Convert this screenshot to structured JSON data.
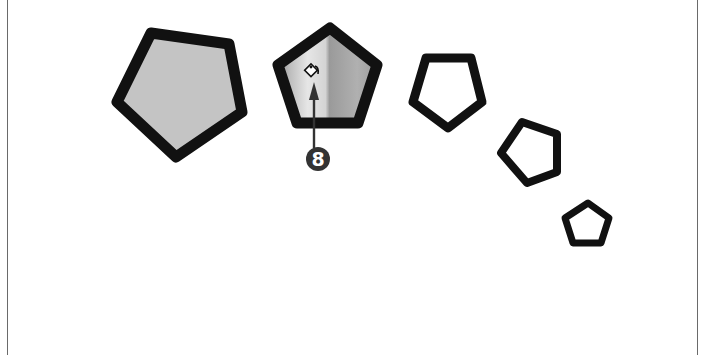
{
  "figure": {
    "frame": {
      "left_x": 7,
      "right_x": 697,
      "color": "#6a6a6a"
    },
    "pentagons": [
      {
        "id": "large-filled",
        "points": "151,33 229,44 242,112 176,157 117,102",
        "fill": "#c4c4c4",
        "stroke": "#111111",
        "stroke_width": 11
      },
      {
        "id": "medium-gradient",
        "points": "330,28 377,65 358,123 297,123 278,65",
        "fill": "url(#metalGrad)",
        "stroke": "#111111",
        "stroke_width": 11
      },
      {
        "id": "medium-outline",
        "points": "426,58 471,58 482,102 448,128 413,102",
        "fill": "#ffffff",
        "stroke": "#111111",
        "stroke_width": 9
      },
      {
        "id": "small-outline",
        "points": "522,122 557,134 557,172 527,183 501,153",
        "fill": "#ffffff",
        "stroke": "#111111",
        "stroke_width": 8
      },
      {
        "id": "smallest-outline",
        "points": "588,203 609,218 601,243 573,243 565,218",
        "fill": "#ffffff",
        "stroke": "#111111",
        "stroke_width": 7
      }
    ],
    "paint_bucket_icon": {
      "name": "paint-bucket-icon",
      "x": 311,
      "y": 71
    },
    "callout": {
      "number": "8",
      "circle": {
        "cx": 318,
        "cy": 159,
        "r": 12,
        "fill": "#333333"
      },
      "arrow": {
        "x": 314,
        "tip_y": 82,
        "end_y": 147
      }
    }
  }
}
